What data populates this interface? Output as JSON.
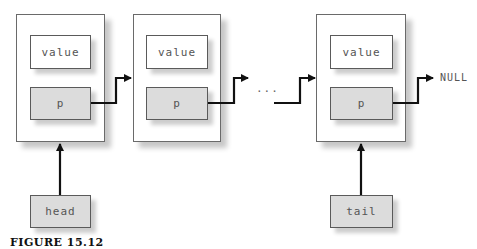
{
  "diagram": {
    "type": "linked-list",
    "nodes": [
      {
        "value_label": "value",
        "pointer_label": "p"
      },
      {
        "value_label": "value",
        "pointer_label": "p"
      },
      {
        "value_label": "value",
        "pointer_label": "p"
      }
    ],
    "ellipsis": "...",
    "terminator": "NULL",
    "head_label": "head",
    "tail_label": "tail"
  },
  "caption": "FIGURE 15.12"
}
